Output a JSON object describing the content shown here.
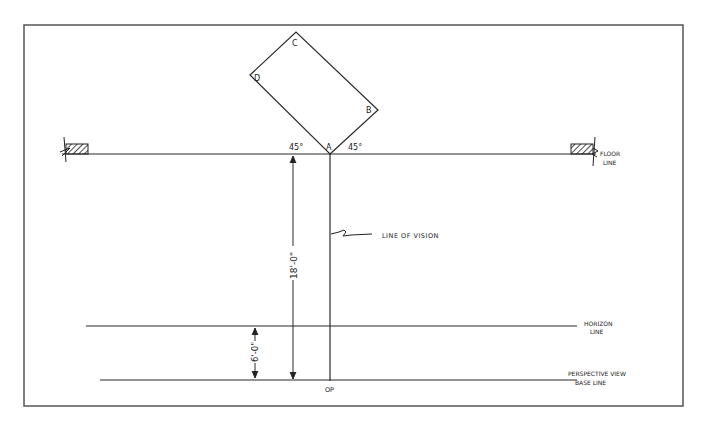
{
  "diagram": {
    "corners": {
      "A": "A",
      "B": "B",
      "C": "C",
      "D": "D"
    },
    "angles": {
      "left": "45°",
      "right": "45°"
    },
    "labels": {
      "floor_line_1": "FLOOR",
      "floor_line_2": "LINE",
      "line_of_vision": "LINE OF VISION",
      "horizon_1": "HORIZON",
      "horizon_2": "LINE",
      "base_1": "PERSPECTIVE VIEW",
      "base_2": "BASE LINE",
      "op": "OP"
    },
    "dimensions": {
      "op_to_floor": "18'-0\"",
      "base_to_horizon": "6'-0\""
    },
    "colors": {
      "line": "#2a2a2a",
      "frame": "#555555"
    }
  }
}
